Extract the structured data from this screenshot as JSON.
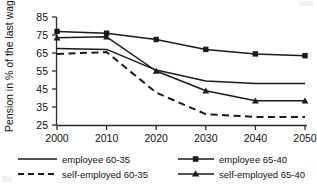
{
  "chart_data": {
    "type": "line",
    "title": "",
    "subtitle": "",
    "xlabel": "",
    "ylabel": "Pension in % of the last wage",
    "x": [
      2000,
      2010,
      2020,
      2030,
      2040,
      2050
    ],
    "xtick_labels": [
      "2000",
      "2010",
      "2020",
      "2030",
      "2040",
      "2050"
    ],
    "ytick_labels": [
      "85",
      "75",
      "65",
      "55",
      "45",
      "35",
      "25"
    ],
    "yticks": [
      85,
      75,
      65,
      55,
      45,
      35,
      25
    ],
    "ylim": [
      25,
      85
    ],
    "xlim": [
      2000,
      2050
    ],
    "grid": false,
    "legend_position": "bottom",
    "series": [
      {
        "name": "employee 60-35",
        "values": [
          67.5,
          67.0,
          55.5,
          49.5,
          48.0,
          48.0
        ],
        "style": "solid",
        "marker": "none",
        "color": "#1a1a1a"
      },
      {
        "name": "self-employed 60-35",
        "values": [
          64.5,
          65.5,
          43.0,
          31.0,
          29.5,
          29.5
        ],
        "style": "dashed",
        "marker": "none",
        "color": "#1a1a1a"
      },
      {
        "name": "employee 65-40",
        "values": [
          77.0,
          76.0,
          72.5,
          67.0,
          64.5,
          63.5
        ],
        "style": "solid",
        "marker": "square",
        "color": "#1a1a1a"
      },
      {
        "name": "self-employed 65-40",
        "values": [
          73.5,
          74.0,
          55.0,
          44.0,
          38.5,
          38.5
        ],
        "style": "solid",
        "marker": "triangle",
        "color": "#1a1a1a"
      }
    ]
  },
  "legend": {
    "entries": [
      {
        "label": "employee 60-35",
        "style": "solid",
        "marker": "none"
      },
      {
        "label": "self-employed 60-35",
        "style": "dashed",
        "marker": "none"
      },
      {
        "label": "employee 65-40",
        "style": "solid",
        "marker": "square"
      },
      {
        "label": "self-employed 65-40",
        "style": "solid",
        "marker": "triangle"
      }
    ]
  },
  "colors": {
    "ink": "#1a1a1a",
    "axis": "#2b2b2b",
    "background": "#ffffff"
  }
}
